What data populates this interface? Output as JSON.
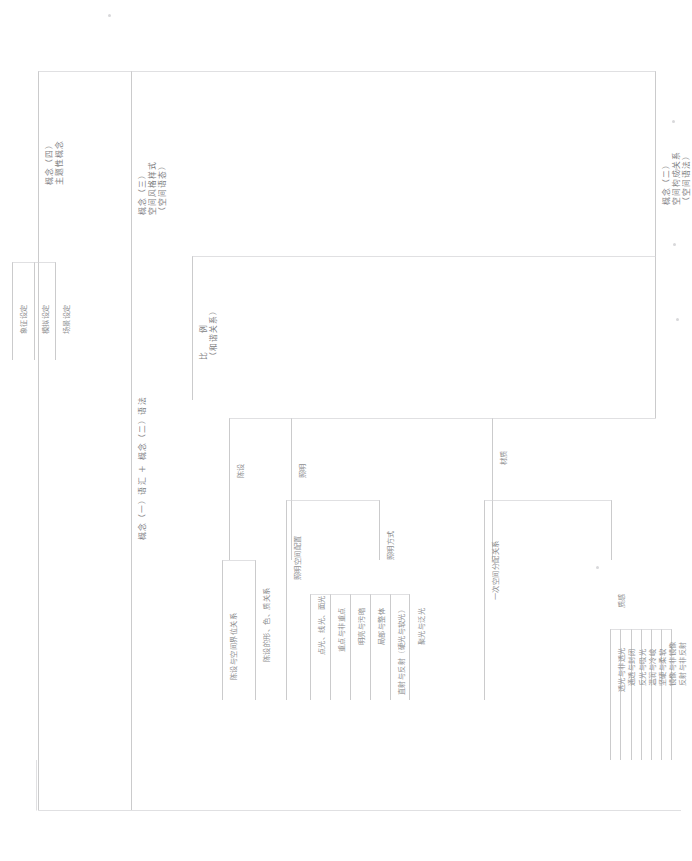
{
  "diagram": {
    "orientation": "rotated-90-ccw",
    "line_color": "#b9b9bb",
    "text_color": "#8e8e90"
  },
  "nodes": {
    "concept2": {
      "label": "概念（二）\n空间构成关系\n（空间语法）",
      "l1": "概念（二）",
      "l2": "空间构成关系",
      "l3": "（空间语法）"
    },
    "concept3": {
      "label": "概念（三）\n空间风格样式\n（空间语态）",
      "l1": "概念（三）",
      "l2": "空间风格样式",
      "l3": "（空间语态）"
    },
    "concept4": {
      "l1": "概念（四）",
      "l2": "主题性概念"
    },
    "concept_combo": {
      "text": "概念（一）语汇 ＋ 概念（二）语法"
    },
    "proportion": {
      "l1": "比　　例",
      "l2": "（和谐关系）"
    },
    "material": {
      "text": "材质"
    },
    "lighting": {
      "text": "照明"
    },
    "furnishing": {
      "text": "陈设"
    },
    "texture": {
      "text": "质感"
    },
    "primary_space": {
      "text": "一次空间分配关系"
    },
    "lighting_mode": {
      "text": "照明方式"
    },
    "lighting_layout": {
      "text": "照明空间配置"
    }
  },
  "leaves": {
    "concept4_children": [
      {
        "text": "场景设定"
      },
      {
        "text": "模拟设定"
      },
      {
        "text": "象征设定"
      }
    ],
    "furnishing_children": [
      {
        "text": "陈设的形、色、质关系"
      },
      {
        "text": "陈设与空间界位关系"
      }
    ],
    "lighting_mode_children": [
      {
        "text": "聚光与泛光"
      },
      {
        "text": "直射与反射（硬光与软光）"
      },
      {
        "text": "局部与整体"
      },
      {
        "text": "明亮与污暗"
      },
      {
        "text": "重点与非重点"
      },
      {
        "text": "点光、线光、面光"
      }
    ],
    "texture_children": [
      {
        "text": "反射与非反射"
      },
      {
        "text": "镜像与非镜像"
      },
      {
        "text": "坚硬与柔软"
      },
      {
        "text": "温润与冷峻"
      },
      {
        "text": "反光与吸光"
      },
      {
        "text": "通透与封闭"
      },
      {
        "text": "透光与非透光"
      }
    ]
  }
}
